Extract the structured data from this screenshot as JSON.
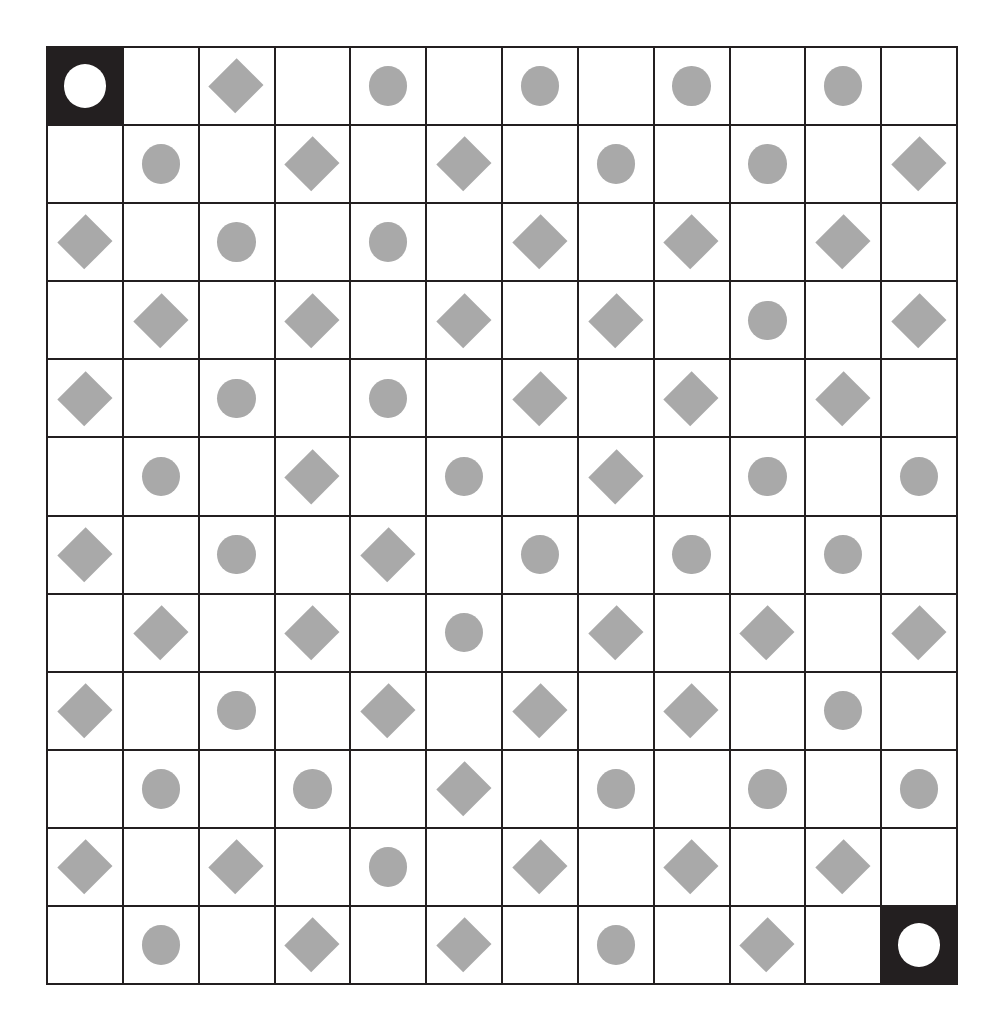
{
  "puzzle": {
    "type": "shape-grid",
    "rows": 12,
    "columns": 12,
    "colors": {
      "shape_fill": "#a9a9a9",
      "grid_line": "#231f20",
      "cell_background": "#ffffff",
      "marked_cell_background": "#231f20",
      "marked_shape_fill": "#ffffff"
    },
    "legend": {
      "circle_label": "circle",
      "diamond_label": "diamond",
      "blank_label": "empty",
      "marked_label": "marked-circle"
    },
    "marked_cells": [
      {
        "row": 1,
        "column": 1,
        "shape": "circle"
      },
      {
        "row": 12,
        "column": 12,
        "shape": "circle"
      }
    ],
    "cells": [
      [
        {
          "shape": "circle",
          "marked": true
        },
        {
          "shape": "blank",
          "marked": false
        },
        {
          "shape": "diamond",
          "marked": false
        },
        {
          "shape": "blank",
          "marked": false
        },
        {
          "shape": "circle",
          "marked": false
        },
        {
          "shape": "blank",
          "marked": false
        },
        {
          "shape": "circle",
          "marked": false
        },
        {
          "shape": "blank",
          "marked": false
        },
        {
          "shape": "circle",
          "marked": false
        },
        {
          "shape": "blank",
          "marked": false
        },
        {
          "shape": "circle",
          "marked": false
        },
        {
          "shape": "blank",
          "marked": false
        }
      ],
      [
        {
          "shape": "blank",
          "marked": false
        },
        {
          "shape": "circle",
          "marked": false
        },
        {
          "shape": "blank",
          "marked": false
        },
        {
          "shape": "diamond",
          "marked": false
        },
        {
          "shape": "blank",
          "marked": false
        },
        {
          "shape": "diamond",
          "marked": false
        },
        {
          "shape": "blank",
          "marked": false
        },
        {
          "shape": "circle",
          "marked": false
        },
        {
          "shape": "blank",
          "marked": false
        },
        {
          "shape": "circle",
          "marked": false
        },
        {
          "shape": "blank",
          "marked": false
        },
        {
          "shape": "diamond",
          "marked": false
        }
      ],
      [
        {
          "shape": "diamond",
          "marked": false
        },
        {
          "shape": "blank",
          "marked": false
        },
        {
          "shape": "circle",
          "marked": false
        },
        {
          "shape": "blank",
          "marked": false
        },
        {
          "shape": "circle",
          "marked": false
        },
        {
          "shape": "blank",
          "marked": false
        },
        {
          "shape": "diamond",
          "marked": false
        },
        {
          "shape": "blank",
          "marked": false
        },
        {
          "shape": "diamond",
          "marked": false
        },
        {
          "shape": "blank",
          "marked": false
        },
        {
          "shape": "diamond",
          "marked": false
        },
        {
          "shape": "blank",
          "marked": false
        }
      ],
      [
        {
          "shape": "blank",
          "marked": false
        },
        {
          "shape": "diamond",
          "marked": false
        },
        {
          "shape": "blank",
          "marked": false
        },
        {
          "shape": "diamond",
          "marked": false
        },
        {
          "shape": "blank",
          "marked": false
        },
        {
          "shape": "diamond",
          "marked": false
        },
        {
          "shape": "blank",
          "marked": false
        },
        {
          "shape": "diamond",
          "marked": false
        },
        {
          "shape": "blank",
          "marked": false
        },
        {
          "shape": "circle",
          "marked": false
        },
        {
          "shape": "blank",
          "marked": false
        },
        {
          "shape": "diamond",
          "marked": false
        }
      ],
      [
        {
          "shape": "diamond",
          "marked": false
        },
        {
          "shape": "blank",
          "marked": false
        },
        {
          "shape": "circle",
          "marked": false
        },
        {
          "shape": "blank",
          "marked": false
        },
        {
          "shape": "circle",
          "marked": false
        },
        {
          "shape": "blank",
          "marked": false
        },
        {
          "shape": "diamond",
          "marked": false
        },
        {
          "shape": "blank",
          "marked": false
        },
        {
          "shape": "diamond",
          "marked": false
        },
        {
          "shape": "blank",
          "marked": false
        },
        {
          "shape": "diamond",
          "marked": false
        },
        {
          "shape": "blank",
          "marked": false
        }
      ],
      [
        {
          "shape": "blank",
          "marked": false
        },
        {
          "shape": "circle",
          "marked": false
        },
        {
          "shape": "blank",
          "marked": false
        },
        {
          "shape": "diamond",
          "marked": false
        },
        {
          "shape": "blank",
          "marked": false
        },
        {
          "shape": "circle",
          "marked": false
        },
        {
          "shape": "blank",
          "marked": false
        },
        {
          "shape": "diamond",
          "marked": false
        },
        {
          "shape": "blank",
          "marked": false
        },
        {
          "shape": "circle",
          "marked": false
        },
        {
          "shape": "blank",
          "marked": false
        },
        {
          "shape": "circle",
          "marked": false
        }
      ],
      [
        {
          "shape": "diamond",
          "marked": false
        },
        {
          "shape": "blank",
          "marked": false
        },
        {
          "shape": "circle",
          "marked": false
        },
        {
          "shape": "blank",
          "marked": false
        },
        {
          "shape": "diamond",
          "marked": false
        },
        {
          "shape": "blank",
          "marked": false
        },
        {
          "shape": "circle",
          "marked": false
        },
        {
          "shape": "blank",
          "marked": false
        },
        {
          "shape": "circle",
          "marked": false
        },
        {
          "shape": "blank",
          "marked": false
        },
        {
          "shape": "circle",
          "marked": false
        },
        {
          "shape": "blank",
          "marked": false
        }
      ],
      [
        {
          "shape": "blank",
          "marked": false
        },
        {
          "shape": "diamond",
          "marked": false
        },
        {
          "shape": "blank",
          "marked": false
        },
        {
          "shape": "diamond",
          "marked": false
        },
        {
          "shape": "blank",
          "marked": false
        },
        {
          "shape": "circle",
          "marked": false
        },
        {
          "shape": "blank",
          "marked": false
        },
        {
          "shape": "diamond",
          "marked": false
        },
        {
          "shape": "blank",
          "marked": false
        },
        {
          "shape": "diamond",
          "marked": false
        },
        {
          "shape": "blank",
          "marked": false
        },
        {
          "shape": "diamond",
          "marked": false
        }
      ],
      [
        {
          "shape": "diamond",
          "marked": false
        },
        {
          "shape": "blank",
          "marked": false
        },
        {
          "shape": "circle",
          "marked": false
        },
        {
          "shape": "blank",
          "marked": false
        },
        {
          "shape": "diamond",
          "marked": false
        },
        {
          "shape": "blank",
          "marked": false
        },
        {
          "shape": "diamond",
          "marked": false
        },
        {
          "shape": "blank",
          "marked": false
        },
        {
          "shape": "diamond",
          "marked": false
        },
        {
          "shape": "blank",
          "marked": false
        },
        {
          "shape": "circle",
          "marked": false
        },
        {
          "shape": "blank",
          "marked": false
        }
      ],
      [
        {
          "shape": "blank",
          "marked": false
        },
        {
          "shape": "circle",
          "marked": false
        },
        {
          "shape": "blank",
          "marked": false
        },
        {
          "shape": "circle",
          "marked": false
        },
        {
          "shape": "blank",
          "marked": false
        },
        {
          "shape": "diamond",
          "marked": false
        },
        {
          "shape": "blank",
          "marked": false
        },
        {
          "shape": "circle",
          "marked": false
        },
        {
          "shape": "blank",
          "marked": false
        },
        {
          "shape": "circle",
          "marked": false
        },
        {
          "shape": "blank",
          "marked": false
        },
        {
          "shape": "circle",
          "marked": false
        }
      ],
      [
        {
          "shape": "diamond",
          "marked": false
        },
        {
          "shape": "blank",
          "marked": false
        },
        {
          "shape": "diamond",
          "marked": false
        },
        {
          "shape": "blank",
          "marked": false
        },
        {
          "shape": "circle",
          "marked": false
        },
        {
          "shape": "blank",
          "marked": false
        },
        {
          "shape": "diamond",
          "marked": false
        },
        {
          "shape": "blank",
          "marked": false
        },
        {
          "shape": "diamond",
          "marked": false
        },
        {
          "shape": "blank",
          "marked": false
        },
        {
          "shape": "diamond",
          "marked": false
        },
        {
          "shape": "blank",
          "marked": false
        }
      ],
      [
        {
          "shape": "blank",
          "marked": false
        },
        {
          "shape": "circle",
          "marked": false
        },
        {
          "shape": "blank",
          "marked": false
        },
        {
          "shape": "diamond",
          "marked": false
        },
        {
          "shape": "blank",
          "marked": false
        },
        {
          "shape": "diamond",
          "marked": false
        },
        {
          "shape": "blank",
          "marked": false
        },
        {
          "shape": "circle",
          "marked": false
        },
        {
          "shape": "blank",
          "marked": false
        },
        {
          "shape": "diamond",
          "marked": false
        },
        {
          "shape": "blank",
          "marked": false
        },
        {
          "shape": "circle",
          "marked": true
        }
      ]
    ]
  }
}
